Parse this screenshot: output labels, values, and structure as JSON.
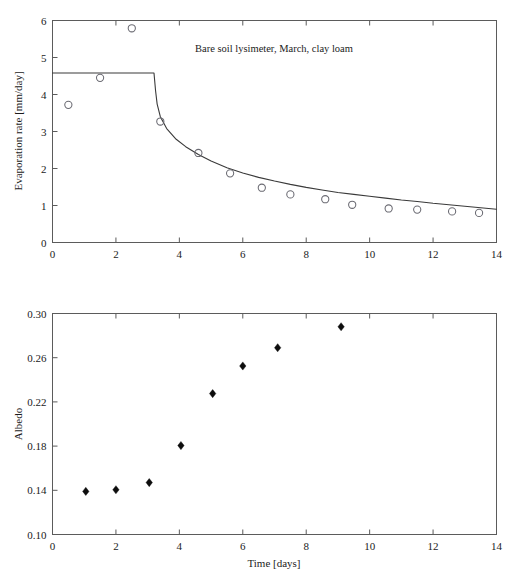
{
  "figure": {
    "background_color": "#ffffff",
    "panel_count": 2
  },
  "chart_data": [
    {
      "id": "evaporation-panel",
      "type": "scatter",
      "title": "Bare soil lysimeter, March, clay loam",
      "xlabel": "",
      "ylabel": "Evaporation rate [mm/day]",
      "xlim": [
        0,
        14
      ],
      "ylim": [
        0,
        6
      ],
      "xticks": [
        0,
        2,
        4,
        6,
        8,
        10,
        12,
        14
      ],
      "xtick_labels": [
        "0",
        "2",
        "4",
        "6",
        "8",
        "10",
        "12",
        "14"
      ],
      "yticks": [
        0,
        1,
        2,
        3,
        4,
        5,
        6
      ],
      "ytick_labels": [
        "0",
        "1",
        "2",
        "3",
        "4",
        "5",
        "6"
      ],
      "grid": false,
      "legend": "none",
      "series": [
        {
          "name": "Measured evaporation rate",
          "marker": "open-circle",
          "marker_color": "#6a6a72",
          "x": [
            0.5,
            1.5,
            2.5,
            3.4,
            4.6,
            5.6,
            6.6,
            7.5,
            8.6,
            9.45,
            10.6,
            11.5,
            12.6,
            13.45
          ],
          "y": [
            3.72,
            4.45,
            5.79,
            3.27,
            2.42,
            1.87,
            1.48,
            1.3,
            1.17,
            1.02,
            0.92,
            0.89,
            0.84,
            0.8
          ]
        },
        {
          "name": "Model curve",
          "marker": "none",
          "line_color": "#3a3a3a",
          "description": "Constant potential rate then falling-rate decay",
          "x": [
            0.0,
            1.0,
            2.0,
            3.0,
            3.2,
            3.25,
            3.3,
            3.4,
            3.6,
            3.9,
            4.2,
            4.6,
            5.0,
            5.5,
            6.0,
            6.5,
            7.0,
            7.5,
            8.0,
            8.5,
            9.0,
            9.5,
            10.0,
            10.5,
            11.0,
            11.5,
            12.0,
            12.5,
            13.0,
            13.5,
            14.0
          ],
          "y": [
            4.58,
            4.58,
            4.58,
            4.58,
            4.58,
            4.1,
            3.74,
            3.4,
            3.08,
            2.79,
            2.59,
            2.38,
            2.2,
            2.02,
            1.88,
            1.76,
            1.66,
            1.57,
            1.49,
            1.42,
            1.35,
            1.3,
            1.25,
            1.2,
            1.15,
            1.11,
            1.06,
            1.02,
            0.98,
            0.94,
            0.9
          ]
        }
      ]
    },
    {
      "id": "albedo-panel",
      "type": "scatter",
      "title": "",
      "xlabel": "Time [days]",
      "ylabel": "Albedo",
      "xlim": [
        0,
        14
      ],
      "ylim": [
        0.1,
        0.3
      ],
      "xticks": [
        0,
        2,
        4,
        6,
        8,
        10,
        12,
        14
      ],
      "xtick_labels": [
        "0",
        "2",
        "4",
        "6",
        "8",
        "10",
        "12",
        "14"
      ],
      "yticks": [
        0.1,
        0.14,
        0.18,
        0.22,
        0.26,
        0.3
      ],
      "ytick_labels": [
        "0.10",
        "0.14",
        "0.18",
        "0.22",
        "0.26",
        "0.30"
      ],
      "grid": false,
      "legend": "none",
      "series": [
        {
          "name": "Measured albedo",
          "marker": "filled-diamond",
          "marker_color": "#0d0d0d",
          "x": [
            1.05,
            2.0,
            3.05,
            4.05,
            5.05,
            6.0,
            7.1,
            9.1
          ],
          "y": [
            0.139,
            0.1405,
            0.147,
            0.1805,
            0.2275,
            0.2525,
            0.269,
            0.288
          ]
        }
      ]
    }
  ]
}
